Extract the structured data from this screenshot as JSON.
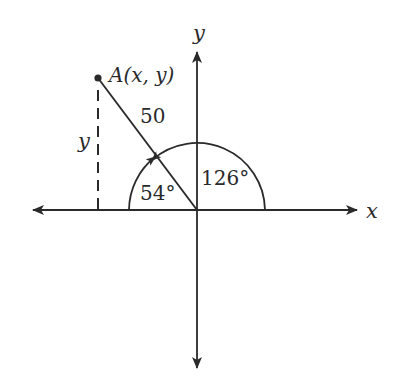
{
  "diagram": {
    "type": "coordinate-plane-angle",
    "axes": {
      "x_label": "x",
      "y_label": "y"
    },
    "point": {
      "label": "A(x, y)",
      "name": "A"
    },
    "segment_length_label": "50",
    "vertical_dashed_label": "y",
    "angles": [
      {
        "label": "54°",
        "measured_from": "negative x-axis",
        "direction": "clockwise toward segment"
      },
      {
        "label": "126°",
        "measured_from": "positive x-axis",
        "direction": "counterclockwise to segment"
      }
    ],
    "colors": {
      "stroke": "#2a2a2a",
      "background": "#ffffff"
    }
  }
}
